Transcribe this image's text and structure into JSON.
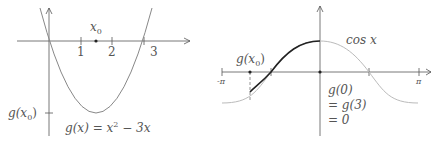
{
  "left_plot": {
    "x0_label": "x",
    "x0_sub": "0",
    "ticks": [
      "1",
      "2",
      "3"
    ],
    "y_label": "g(x",
    "y_label_sub": "0",
    "y_label_close": ")",
    "formula": "g(x) = x",
    "formula_sup": "2",
    "formula_tail": " − 3x"
  },
  "right_plot": {
    "curve_label": "cos x",
    "gx0_label": "g(x",
    "gx0_sub": "0",
    "gx0_close": ")",
    "neg_pi": "-π",
    "pos_pi": "π",
    "eq_line1": "g(0)",
    "eq_line2": "= g(3)",
    "eq_line3": "= 0"
  },
  "colors": {
    "axis": "#555555",
    "curve_gray": "#888888",
    "curve_light": "#bbbbbb",
    "curve_bold": "#222222"
  }
}
